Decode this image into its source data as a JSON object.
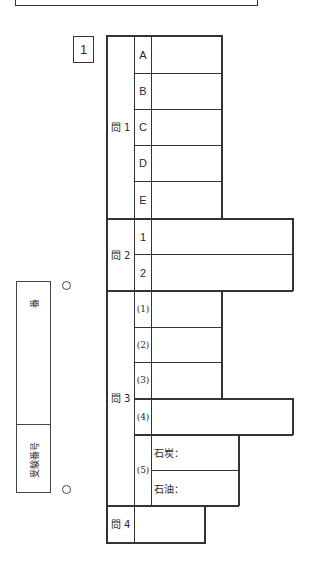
{
  "sheet": {
    "question_number": "1",
    "student_id_box": {
      "label": "受験番号",
      "suffix": "番"
    },
    "questions": [
      {
        "label": "問 1",
        "items": [
          {
            "label": "A",
            "value": ""
          },
          {
            "label": "B",
            "value": ""
          },
          {
            "label": "C",
            "value": ""
          },
          {
            "label": "D",
            "value": ""
          },
          {
            "label": "E",
            "value": ""
          }
        ]
      },
      {
        "label": "問 2",
        "items": [
          {
            "label": "1",
            "value": ""
          },
          {
            "label": "2",
            "value": ""
          }
        ]
      },
      {
        "label": "問 3",
        "items": [
          {
            "label": "(1)",
            "value": ""
          },
          {
            "label": "(2)",
            "value": ""
          },
          {
            "label": "(3)",
            "value": ""
          },
          {
            "label": "(4)",
            "value": ""
          },
          {
            "label": "(5)",
            "subitems": [
              {
                "label": "石炭：",
                "value": ""
              },
              {
                "label": "石油：",
                "value": ""
              }
            ]
          }
        ]
      },
      {
        "label": "問 4",
        "value": ""
      }
    ]
  }
}
